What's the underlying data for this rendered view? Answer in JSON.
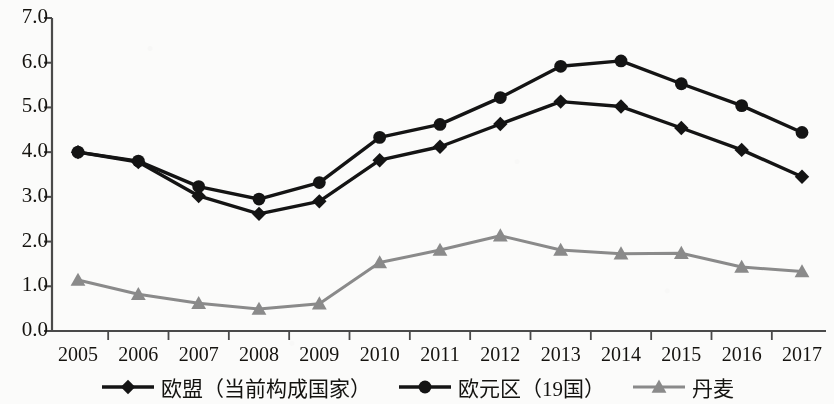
{
  "chart_data": {
    "type": "line",
    "title": "",
    "xlabel": "",
    "ylabel": "",
    "categories": [
      "2005",
      "2006",
      "2007",
      "2008",
      "2009",
      "2010",
      "2011",
      "2012",
      "2013",
      "2014",
      "2015",
      "2016",
      "2017"
    ],
    "ylim": [
      0.0,
      7.0
    ],
    "ytick_labels": [
      "0.0",
      "1.0",
      "2.0",
      "3.0",
      "4.0",
      "5.0",
      "6.0",
      "7.0"
    ],
    "ytick_values": [
      0.0,
      1.0,
      2.0,
      3.0,
      4.0,
      5.0,
      6.0,
      7.0
    ],
    "grid": false,
    "legend_position": "bottom",
    "series": [
      {
        "name": "欧盟（当前构成国家）",
        "marker": "diamond",
        "color": "#141414",
        "values": [
          4.0,
          3.78,
          3.02,
          2.62,
          2.9,
          3.82,
          4.12,
          4.63,
          5.13,
          5.02,
          4.54,
          4.05,
          3.45
        ]
      },
      {
        "name": "欧元区（19国）",
        "marker": "circle",
        "color": "#141414",
        "values": [
          4.0,
          3.8,
          3.23,
          2.95,
          3.32,
          4.33,
          4.62,
          5.22,
          5.92,
          6.04,
          5.53,
          5.04,
          4.44
        ]
      },
      {
        "name": "丹麦",
        "marker": "triangle",
        "color": "#8a8a8a",
        "values": [
          1.14,
          0.82,
          0.62,
          0.49,
          0.61,
          1.53,
          1.81,
          2.13,
          1.81,
          1.73,
          1.74,
          1.43,
          1.33
        ]
      }
    ]
  },
  "axis": {
    "y_labels": [
      "7.0",
      "6.0",
      "5.0",
      "4.0",
      "3.0",
      "2.0",
      "1.0",
      "0.0"
    ],
    "x_labels": [
      "2005",
      "2006",
      "2007",
      "2008",
      "2009",
      "2010",
      "2011",
      "2012",
      "2013",
      "2014",
      "2015",
      "2016",
      "2017"
    ]
  },
  "legend": {
    "items": [
      {
        "label": "欧盟（当前构成国家）",
        "marker": "diamond-marker-icon",
        "color": "#141414"
      },
      {
        "label": "欧元区（19国）",
        "marker": "circle-marker-icon",
        "color": "#141414"
      },
      {
        "label": "丹麦",
        "marker": "triangle-marker-icon",
        "color": "#8a8a8a"
      }
    ]
  }
}
